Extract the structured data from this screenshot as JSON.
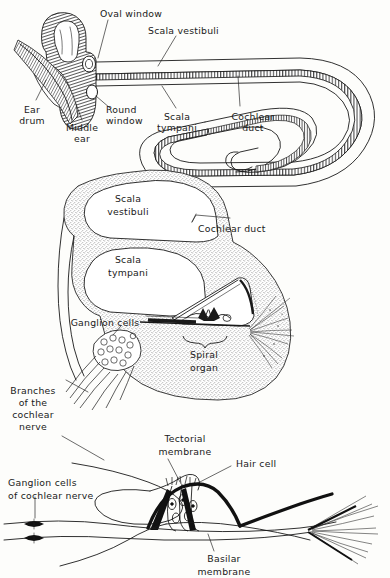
{
  "figure": {
    "background_color": "#fdfdfb",
    "ink_color": "#1a1a1a",
    "panels": [
      {
        "id": "panel-uncoiled-cochlea",
        "name": "Uncoiled cochlea with middle ear",
        "labels": [
          "Oval window",
          "Scala vestibuli",
          "Ear drum",
          "Middle ear",
          "Round window",
          "Scala tympani",
          "Cochlear duct"
        ]
      },
      {
        "id": "panel-cross-section",
        "name": "Cochlear cross section",
        "labels": [
          "Scala vestibuli",
          "Cochlear duct",
          "Scala tympani",
          "Ganglion cells",
          "Spiral organ",
          "Branches of the cochlear nerve"
        ]
      },
      {
        "id": "panel-spiral-organ-detail",
        "name": "Spiral organ detail",
        "labels": [
          "Tectorial membrane",
          "Hair cell",
          "Ganglion cells of cochlear nerve",
          "Basilar membrane"
        ]
      }
    ]
  },
  "panel1": {
    "oval_window": "Oval window",
    "scala_vestibuli": "Scala vestibuli",
    "ear_drum_line1": "Ear",
    "ear_drum_line2": "drum",
    "middle_ear_line1": "Middle",
    "middle_ear_line2": "ear",
    "round_window_line1": "Round",
    "round_window_line2": "window",
    "scala_tympani_line1": "Scala",
    "scala_tympani_line2": "tympani",
    "cochlear_duct_line1": "Cochlear",
    "cochlear_duct_line2": "duct"
  },
  "panel2": {
    "scala_vestibuli_line1": "Scala",
    "scala_vestibuli_line2": "vestibuli",
    "cochlear_duct": "Cochlear duct",
    "scala_tympani_line1": "Scala",
    "scala_tympani_line2": "tympani",
    "ganglion_cells": "Ganglion cells",
    "spiral_organ_line1": "Spiral",
    "spiral_organ_line2": "organ",
    "branches_line1": "Branches",
    "branches_line2": "of the",
    "branches_line3": "cochlear",
    "branches_line4": "nerve"
  },
  "panel3": {
    "tectorial_line1": "Tectorial",
    "tectorial_line2": "membrane",
    "hair_cell": "Hair cell",
    "ganglion_line1": "Ganglion cells",
    "ganglion_line2": "of cochlear nerve",
    "basilar_line1": "Basilar",
    "basilar_line2": "membrane"
  }
}
